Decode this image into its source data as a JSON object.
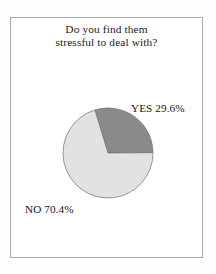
{
  "figure": {
    "title_lines": [
      "Do you find them",
      "stressful to deal with?"
    ],
    "frame_color": "#a8a8a8",
    "background": "#ffffff"
  },
  "labels": {
    "yes": "YES 29.6%",
    "no": "NO 70.4%"
  },
  "chart_data": {
    "type": "pie",
    "title": "Do you find them stressful to deal with?",
    "categories": [
      "YES",
      "NO"
    ],
    "values": [
      29.6,
      70.4
    ],
    "value_labels": [
      "YES 29.6%",
      "NO 70.4%"
    ],
    "units": "percent",
    "colors": [
      "#8a8a8a",
      "#e2e2e2"
    ],
    "slice_edge_color": "#6e6e6e",
    "start_angle_deg": -17,
    "direction": "clockwise",
    "legend": "none",
    "labels_position": "outside",
    "grid": false,
    "center_px": [
      97,
      135
    ],
    "radius_px": 45
  }
}
